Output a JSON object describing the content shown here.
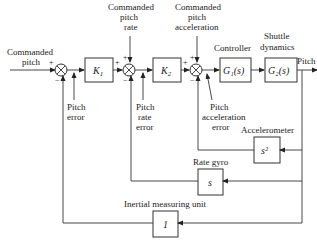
{
  "diagram": {
    "type": "block-diagram",
    "input": {
      "line1": "Commanded",
      "line2": "pitch"
    },
    "output": "Pitch",
    "blocks": {
      "k1": "K",
      "k1_sub": "1",
      "k2": "K",
      "k2_sub": "2",
      "g1": "G₁(s)",
      "g2": "G₂(s)",
      "accel": "s²",
      "rategyro": "s",
      "imu": "1"
    },
    "block_titles": {
      "controller": "Controller",
      "shuttle_line1": "Shuttle",
      "shuttle_line2": "dynamics",
      "accelerometer": "Accelerometer",
      "rate_gyro": "Rate gyro",
      "imu": "Inertial measuring unit"
    },
    "references": {
      "rate": {
        "line1": "Commanded",
        "line2": "pitch",
        "line3": "rate"
      },
      "accel": {
        "line1": "Commanded",
        "line2": "pitch",
        "line3": "acceleration"
      }
    },
    "errors": {
      "pitch": {
        "line1": "Pitch",
        "line2": "error"
      },
      "rate": {
        "line1": "Pitch",
        "line2": "rate",
        "line3": "error"
      },
      "accel": {
        "line1": "Pitch",
        "line2": "acceleration",
        "line3": "error"
      }
    },
    "signs": {
      "plus": "+",
      "minus": "−"
    }
  }
}
